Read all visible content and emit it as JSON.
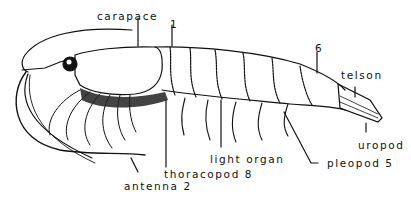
{
  "diagram": {
    "labels": {
      "carapace": "carapace",
      "segment_1": "1",
      "segment_6": "6",
      "telson": "telson",
      "uropod": "uropod",
      "pleopod": "pleopod 5",
      "light_organ": "light organ",
      "thoracopod": "thoracopod 8",
      "antenna": "antenna 2"
    },
    "colors": {
      "ink": "#111111",
      "background": "#ffffff"
    }
  }
}
